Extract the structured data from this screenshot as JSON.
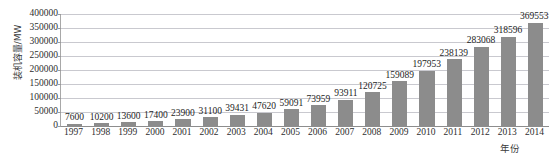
{
  "chart_data": {
    "type": "bar",
    "title": "",
    "xlabel": "年份",
    "ylabel": "装机容量/MW",
    "categories": [
      "1997",
      "1998",
      "1999",
      "2000",
      "2001",
      "2002",
      "2003",
      "2004",
      "2005",
      "2006",
      "2007",
      "2008",
      "2009",
      "2010",
      "2011",
      "2012",
      "2013",
      "2014"
    ],
    "values": [
      7600,
      10200,
      13600,
      17400,
      23900,
      31100,
      39431,
      47620,
      59091,
      73959,
      93911,
      120725,
      159089,
      197953,
      238139,
      283068,
      318596,
      369553
    ],
    "series": [
      {
        "name": "装机容量",
        "values": [
          7600,
          10200,
          13600,
          17400,
          23900,
          31100,
          39431,
          47620,
          59091,
          73959,
          93911,
          120725,
          159089,
          197953,
          238139,
          283068,
          318596,
          369553
        ]
      }
    ],
    "ylim": [
      0,
      400000
    ],
    "ytick_interval": 50000,
    "yticks": [
      "0",
      "50000",
      "100000",
      "150000",
      "200000",
      "250000",
      "300000",
      "350000",
      "400000"
    ],
    "ytick_values": [
      0,
      50000,
      100000,
      150000,
      200000,
      250000,
      300000,
      350000,
      400000
    ],
    "grid": true,
    "legend": false,
    "legend_position": "none",
    "bar_color": "#8c8c8c",
    "gridline_color": "#c9c9cf",
    "plot_background": "#ffffff",
    "data_labels": [
      "7600",
      "10200",
      "13600",
      "17400",
      "23900",
      "31100",
      "39431",
      "47620",
      "59091",
      "73959",
      "93911",
      "120725",
      "159089",
      "197953",
      "238139",
      "283068",
      "318596",
      "369553"
    ]
  },
  "figure": {
    "top_clipped_text": "",
    "axis_line_color": "#9a9a9a"
  }
}
